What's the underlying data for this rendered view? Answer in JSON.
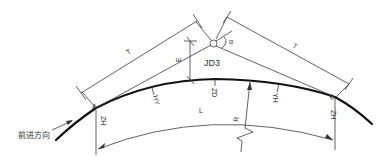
{
  "diagram": {
    "title": "",
    "type": "horizontal-curve-with-transition-spirals",
    "labels": {
      "tangent_left": "T",
      "tangent_right": "T",
      "external_distance": "E",
      "deflection_angle": "α",
      "intersection_point": "JD3",
      "point_a": "A",
      "point_b": "B",
      "curve_length": "L",
      "radius": "R",
      "zh_start": "ZH",
      "hy_start": "HY",
      "zd_mid": "ZD",
      "yh_end": "YH",
      "zh_end": "ZH",
      "direction": "前进方向"
    },
    "colors": {
      "line": "#3a3a3a",
      "curve": "#111111",
      "background": "#ffffff"
    }
  }
}
